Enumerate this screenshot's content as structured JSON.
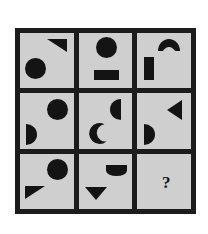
{
  "puzzle": {
    "type": "matrix-reasoning",
    "title": "3x3 shape matrix",
    "grid_rows": 3,
    "grid_columns": 3,
    "frame_color": "#1c1c1c",
    "cell_background": "#cfcfcf",
    "shape_color": "#141414",
    "page_background": "#ffffff",
    "missing_cell_label": "?",
    "cells": [
      {
        "index": 1,
        "row": 1,
        "column": 1,
        "name": "cell-r1c1",
        "shapes": [
          {
            "kind": "triangle",
            "variant": "down-left",
            "position": "top-right"
          },
          {
            "kind": "circle",
            "variant": "full",
            "position": "bottom-left"
          }
        ]
      },
      {
        "index": 2,
        "row": 1,
        "column": 2,
        "name": "cell-r1c2",
        "shapes": [
          {
            "kind": "circle",
            "variant": "full",
            "position": "top-center"
          },
          {
            "kind": "rectangle",
            "variant": "horizontal",
            "position": "bottom-center"
          }
        ]
      },
      {
        "index": 3,
        "row": 1,
        "column": 3,
        "name": "cell-r1c3",
        "shapes": [
          {
            "kind": "crescent",
            "variant": "arc-opening-down",
            "position": "top-center"
          },
          {
            "kind": "rectangle",
            "variant": "vertical",
            "position": "bottom-left"
          }
        ]
      },
      {
        "index": 4,
        "row": 2,
        "column": 1,
        "name": "cell-r2c1",
        "shapes": [
          {
            "kind": "circle",
            "variant": "full",
            "position": "top-right"
          },
          {
            "kind": "half-circle",
            "variant": "bulge-right",
            "position": "bottom-left"
          }
        ]
      },
      {
        "index": 5,
        "row": 2,
        "column": 2,
        "name": "cell-r2c2",
        "shapes": [
          {
            "kind": "half-circle",
            "variant": "bulge-left",
            "position": "top-right"
          },
          {
            "kind": "crescent",
            "variant": "opening-upper-right",
            "position": "bottom-left"
          }
        ]
      },
      {
        "index": 6,
        "row": 2,
        "column": 3,
        "name": "cell-r2c3",
        "shapes": [
          {
            "kind": "triangle",
            "variant": "pointing-left",
            "position": "top-right"
          },
          {
            "kind": "half-circle",
            "variant": "bulge-right",
            "position": "bottom-left"
          }
        ]
      },
      {
        "index": 7,
        "row": 3,
        "column": 1,
        "name": "cell-r3c1",
        "shapes": [
          {
            "kind": "circle",
            "variant": "full",
            "position": "top-right"
          },
          {
            "kind": "triangle",
            "variant": "down-right",
            "position": "bottom-left"
          }
        ]
      },
      {
        "index": 8,
        "row": 3,
        "column": 2,
        "name": "cell-r3c2",
        "shapes": [
          {
            "kind": "half-circle",
            "variant": "bulge-down",
            "position": "top-right"
          },
          {
            "kind": "triangle",
            "variant": "pointing-down",
            "position": "bottom-left"
          }
        ]
      },
      {
        "index": 9,
        "row": 3,
        "column": 3,
        "name": "cell-r3c3",
        "shapes": [],
        "label": "?"
      }
    ]
  }
}
